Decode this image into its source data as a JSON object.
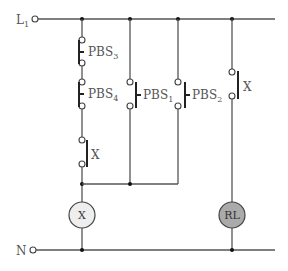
{
  "rails": {
    "top": {
      "label": "L",
      "subscript": "1"
    },
    "bottom": {
      "label": "N"
    }
  },
  "contacts": {
    "pbs3": {
      "label": "PBS",
      "subscript": "3",
      "type": "normally-closed"
    },
    "pbs4": {
      "label": "PBS",
      "subscript": "4",
      "type": "normally-closed"
    },
    "pbs1": {
      "label": "PBS",
      "subscript": "1",
      "type": "normally-open"
    },
    "pbs2": {
      "label": "PBS",
      "subscript": "2",
      "type": "normally-open"
    },
    "x_aux_left": {
      "label": "X",
      "type": "normally-open"
    },
    "x_aux_right": {
      "label": "X",
      "type": "normally-open"
    }
  },
  "loads": {
    "relay_x": {
      "label": "X",
      "fill": "#eeeeee"
    },
    "lamp_rl": {
      "label": "RL",
      "fill": "#aaaaaa"
    }
  },
  "colors": {
    "wire": "#555555",
    "contact_bar": "#222222",
    "relay_fill": "#eeeeee",
    "lamp_fill": "#aaaaaa"
  }
}
